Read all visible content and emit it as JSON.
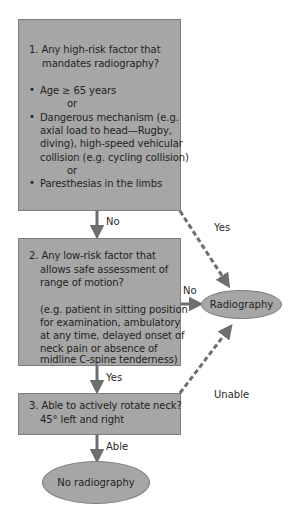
{
  "flowchart": {
    "step1": {
      "question_line1": "1.  Any high-risk factor that",
      "question_line2": "mandates radiography?",
      "items": [
        {
          "bullet": "•",
          "lines": [
            "Age ≥ 65 years"
          ]
        },
        {
          "connector": "or"
        },
        {
          "bullet": "•",
          "lines": [
            "Dangerous mechanism (e.g.",
            "axial load to head—Rugby,",
            "diving), high-speed vehicular",
            "collision (e.g. cycling collision)"
          ]
        },
        {
          "connector": "or"
        },
        {
          "bullet": "•",
          "lines": [
            "Paresthesias in the limbs"
          ]
        }
      ]
    },
    "step2": {
      "question_lines": [
        "2.  Any low-risk factor that",
        "allows safe assessment of",
        "range of motion?"
      ],
      "example_lines": [
        "(e.g. patient in sitting position",
        "for examination, ambulatory",
        "at any time, delayed onset of",
        "neck pain or absence of",
        "midline C-spine tenderness)"
      ]
    },
    "step3": {
      "question_lines": [
        "3.  Able to actively rotate neck?",
        "45° left and right"
      ]
    },
    "outcomes": {
      "radiography": "Radiography",
      "no_radiography": "No radiography"
    },
    "edge_labels": {
      "step1_no": "No",
      "step1_yes": "Yes",
      "step2_no": "No",
      "step2_yes": "Yes",
      "step3_unable": "Unable",
      "step3_able": "Able"
    },
    "colors": {
      "box_fill": "#a6a6a6",
      "box_border": "#7d7d7d",
      "arrow": "#6e6e6e"
    }
  }
}
